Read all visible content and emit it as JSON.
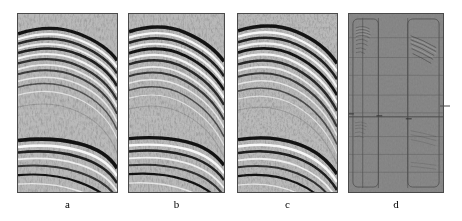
{
  "figure": {
    "background_color": "#ffffff",
    "width": 462,
    "height": 221,
    "panel_count": 4,
    "panel_border_color": "#4a4a4a",
    "base_gray": "#808080",
    "label_color": "#000000"
  },
  "panels": [
    {
      "id": "panel-a",
      "label": "a",
      "kind": "seismic-section",
      "x": 17,
      "y": 13,
      "w": 101,
      "h": 180,
      "label_x": 17,
      "label_y": 198,
      "label_w": 101,
      "description": "Original seismic gather with curved anticlinal reflectors",
      "reflector_count": 14,
      "has_residual_boxes": false
    },
    {
      "id": "panel-b",
      "label": "b",
      "kind": "seismic-section",
      "x": 128,
      "y": 13,
      "w": 97,
      "h": 180,
      "label_x": 128,
      "label_y": 198,
      "label_w": 97,
      "description": "Processed seismic gather with enhanced reflector continuity",
      "reflector_count": 14,
      "has_residual_boxes": false
    },
    {
      "id": "panel-c",
      "label": "c",
      "kind": "seismic-section",
      "x": 237,
      "y": 13,
      "w": 101,
      "h": 180,
      "label_x": 237,
      "label_y": 198,
      "label_w": 101,
      "description": "Reconstructed seismic gather with steeper reflector dip",
      "reflector_count": 14,
      "has_residual_boxes": false
    },
    {
      "id": "panel-d",
      "label": "d",
      "kind": "residual-section",
      "x": 348,
      "y": 13,
      "w": 96,
      "h": 180,
      "label_x": 348,
      "label_y": 198,
      "label_w": 96,
      "description": "Residual difference section, near-uniform gray with faint leakage inside marked boxes",
      "reflector_count": 0,
      "has_residual_boxes": true,
      "boxes": [
        {
          "x": 4,
          "y": 5,
          "w": 26,
          "h": 170,
          "name": "residual-box-left"
        },
        {
          "x": 60,
          "y": 5,
          "w": 32,
          "h": 170,
          "name": "residual-box-right"
        }
      ],
      "vertical_lines": [
        14,
        30,
        60,
        91
      ],
      "horizontal_lines": [
        24,
        44,
        62,
        82,
        100,
        104,
        124,
        142,
        160
      ]
    }
  ],
  "chart_data": {
    "type": "heatmap",
    "xlabel": "",
    "ylabel": "",
    "colormap": "grayscale",
    "value_range": [
      -1,
      1
    ],
    "panels": [
      "a",
      "b",
      "c",
      "d"
    ],
    "series": [
      {
        "name": "a",
        "reflector_events": [
          {
            "t": 0.06,
            "amp": 1.0,
            "curvature": 0.55,
            "dip": 0.22
          },
          {
            "t": 0.1,
            "amp": 0.8,
            "curvature": 0.52,
            "dip": 0.24
          },
          {
            "t": 0.14,
            "amp": 0.9,
            "curvature": 0.5,
            "dip": 0.26
          },
          {
            "t": 0.18,
            "amp": 0.7,
            "curvature": 0.48,
            "dip": 0.28
          },
          {
            "t": 0.22,
            "amp": 0.85,
            "curvature": 0.46,
            "dip": 0.3
          },
          {
            "t": 0.27,
            "amp": 0.6,
            "curvature": 0.44,
            "dip": 0.32
          },
          {
            "t": 0.32,
            "amp": 0.7,
            "curvature": 0.42,
            "dip": 0.34
          },
          {
            "t": 0.4,
            "amp": 0.45,
            "curvature": 0.38,
            "dip": 0.36
          },
          {
            "t": 0.72,
            "amp": 1.0,
            "curvature": 0.3,
            "dip": 0.34
          },
          {
            "t": 0.78,
            "amp": 0.85,
            "curvature": 0.29,
            "dip": 0.36
          },
          {
            "t": 0.84,
            "amp": 0.7,
            "curvature": 0.28,
            "dip": 0.38
          },
          {
            "t": 0.92,
            "amp": 0.6,
            "curvature": 0.27,
            "dip": 0.4
          }
        ]
      },
      {
        "name": "b",
        "reflector_events": [
          {
            "t": 0.06,
            "amp": 1.0,
            "curvature": 0.55,
            "dip": 0.22
          },
          {
            "t": 0.1,
            "amp": 0.8,
            "curvature": 0.52,
            "dip": 0.24
          },
          {
            "t": 0.14,
            "amp": 0.9,
            "curvature": 0.5,
            "dip": 0.26
          },
          {
            "t": 0.18,
            "amp": 0.7,
            "curvature": 0.48,
            "dip": 0.28
          },
          {
            "t": 0.22,
            "amp": 0.85,
            "curvature": 0.46,
            "dip": 0.3
          },
          {
            "t": 0.27,
            "amp": 0.6,
            "curvature": 0.44,
            "dip": 0.32
          },
          {
            "t": 0.32,
            "amp": 0.7,
            "curvature": 0.42,
            "dip": 0.34
          },
          {
            "t": 0.4,
            "amp": 0.45,
            "curvature": 0.38,
            "dip": 0.36
          },
          {
            "t": 0.72,
            "amp": 1.0,
            "curvature": 0.3,
            "dip": 0.34
          },
          {
            "t": 0.78,
            "amp": 0.85,
            "curvature": 0.29,
            "dip": 0.36
          },
          {
            "t": 0.84,
            "amp": 0.7,
            "curvature": 0.28,
            "dip": 0.38
          },
          {
            "t": 0.92,
            "amp": 0.6,
            "curvature": 0.27,
            "dip": 0.4
          }
        ]
      },
      {
        "name": "c",
        "reflector_events": [
          {
            "t": 0.06,
            "amp": 1.0,
            "curvature": 0.58,
            "dip": 0.26
          },
          {
            "t": 0.1,
            "amp": 0.8,
            "curvature": 0.55,
            "dip": 0.28
          },
          {
            "t": 0.14,
            "amp": 0.9,
            "curvature": 0.53,
            "dip": 0.3
          },
          {
            "t": 0.18,
            "amp": 0.7,
            "curvature": 0.51,
            "dip": 0.32
          },
          {
            "t": 0.22,
            "amp": 0.85,
            "curvature": 0.49,
            "dip": 0.34
          },
          {
            "t": 0.27,
            "amp": 0.6,
            "curvature": 0.47,
            "dip": 0.36
          },
          {
            "t": 0.32,
            "amp": 0.7,
            "curvature": 0.45,
            "dip": 0.38
          },
          {
            "t": 0.4,
            "amp": 0.45,
            "curvature": 0.41,
            "dip": 0.4
          },
          {
            "t": 0.72,
            "amp": 1.0,
            "curvature": 0.33,
            "dip": 0.4
          },
          {
            "t": 0.78,
            "amp": 0.85,
            "curvature": 0.32,
            "dip": 0.42
          },
          {
            "t": 0.84,
            "amp": 0.7,
            "curvature": 0.31,
            "dip": 0.44
          },
          {
            "t": 0.92,
            "amp": 0.6,
            "curvature": 0.3,
            "dip": 0.46
          }
        ]
      },
      {
        "name": "d",
        "reflector_events": []
      }
    ]
  }
}
